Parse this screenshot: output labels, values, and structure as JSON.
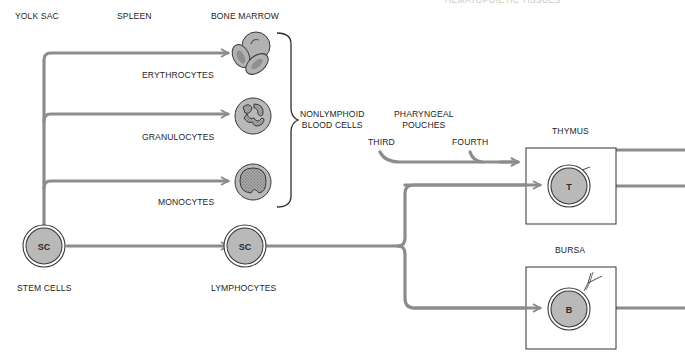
{
  "heading_partial": "HEMATOPOIETIC TISSUES",
  "locations": {
    "yolk_sac": "YOLK SAC",
    "spleen": "SPLEEN",
    "bone_marrow": "BONE MARROW"
  },
  "nonlymphoid": {
    "erythrocytes": "ERYTHROCYTES",
    "granulocytes": "GRANULOCYTES",
    "monocytes": "MONOCYTES",
    "group_label_line1": "NONLYMPHOID",
    "group_label_line2": "BLOOD CELLS"
  },
  "pharyngeal": {
    "label_line1": "PHARYNGEAL",
    "label_line2": "POUCHES",
    "third": "THIRD",
    "fourth": "FOURTH"
  },
  "stem": {
    "cell_letter": "SC",
    "label": "STEM CELLS"
  },
  "lymphocytes": {
    "cell_letter": "SC",
    "label": "LYMPHOCYTES"
  },
  "thymus": {
    "label": "THYMUS",
    "cell_letter": "T"
  },
  "bursa": {
    "label": "BURSA",
    "cell_letter": "B"
  },
  "colors": {
    "path": "#8c8c8c",
    "cell_fill": "#b9b9b9",
    "outline": "#3a3a3a",
    "box": "#333333"
  }
}
